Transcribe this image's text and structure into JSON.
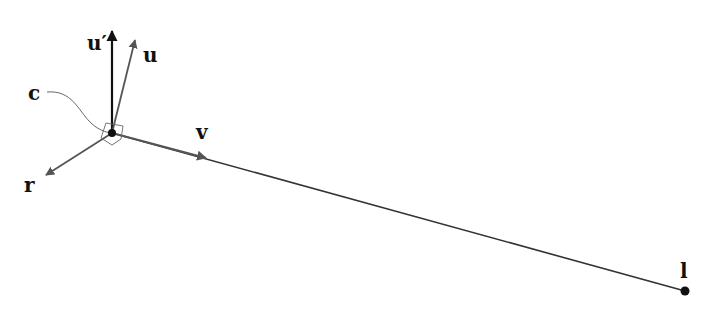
{
  "diagram": {
    "type": "vector-frame",
    "labels": {
      "u_prime": "u′",
      "u": "u",
      "c": "c",
      "v": "v",
      "r": "r",
      "l": "l"
    },
    "points": {
      "c": {
        "x": 112,
        "y": 133
      },
      "l": {
        "x": 685,
        "y": 291
      }
    },
    "vectors": [
      {
        "name": "u_prime",
        "from": "c",
        "to": {
          "x": 112,
          "y": 30
        },
        "color": "#111111"
      },
      {
        "name": "u",
        "from": "c",
        "to": {
          "x": 135,
          "y": 40
        },
        "color": "#555555"
      },
      {
        "name": "r",
        "from": "c",
        "to": {
          "x": 45,
          "y": 175
        },
        "color": "#555555"
      },
      {
        "name": "v",
        "from": "c",
        "to": {
          "x": 205,
          "y": 158
        },
        "color": "#555555"
      }
    ],
    "colors": {
      "dark": "#111111",
      "gray": "#555555",
      "line": "#333333"
    }
  }
}
